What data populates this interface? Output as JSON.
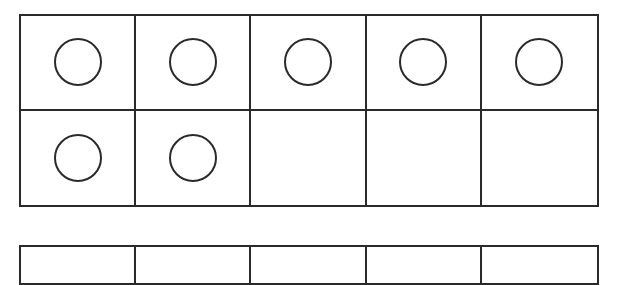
{
  "ten_frame_1": {
    "rows": 2,
    "columns": 5,
    "cells": [
      {
        "filled": true
      },
      {
        "filled": true
      },
      {
        "filled": true
      },
      {
        "filled": true
      },
      {
        "filled": true
      },
      {
        "filled": true
      },
      {
        "filled": true
      },
      {
        "filled": false
      },
      {
        "filled": false
      },
      {
        "filled": false
      }
    ],
    "count": 7
  },
  "ten_frame_2": {
    "columns": 5,
    "partially_visible": true
  },
  "colors": {
    "line": "#2a2a2a",
    "background": "#ffffff"
  }
}
